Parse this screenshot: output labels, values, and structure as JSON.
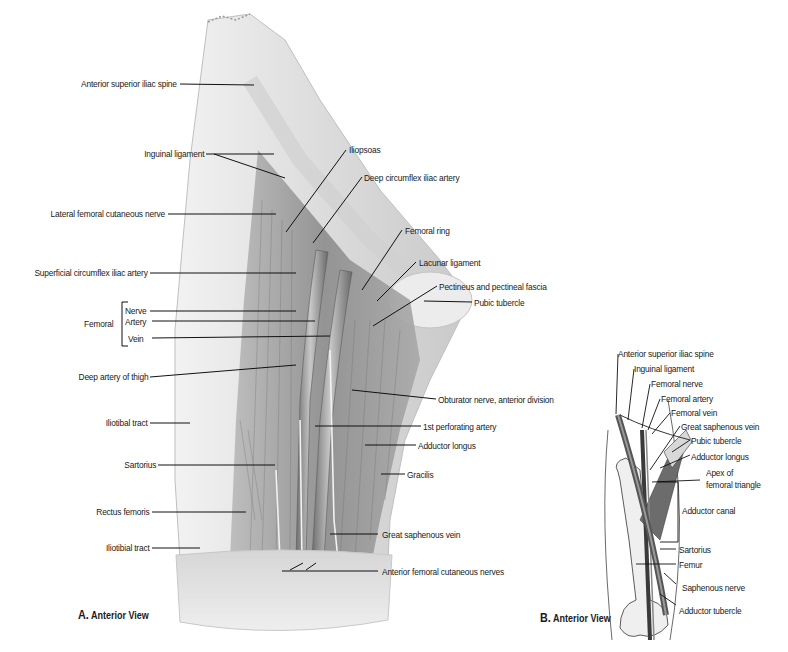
{
  "figure_a": {
    "caption_letter": "A.",
    "caption_text": "Anterior View",
    "labels_left": [
      {
        "id": "asis",
        "text": "Anterior superior iliac spine"
      },
      {
        "id": "inguinal",
        "text": "Inguinal ligament"
      },
      {
        "id": "lfcn",
        "text": "Lateral femoral cutaneous nerve"
      },
      {
        "id": "scia",
        "text": "Superficial circumflex iliac artery"
      },
      {
        "id": "deep_thigh",
        "text": "Deep artery of thigh"
      },
      {
        "id": "iliotibal",
        "text": "Iliotibal tract"
      },
      {
        "id": "sartorius",
        "text": "Sartorius"
      },
      {
        "id": "rectus",
        "text": "Rectus femoris"
      },
      {
        "id": "iliotibial",
        "text": "Iliotibial tract"
      }
    ],
    "femoral_group": {
      "title": "Femoral",
      "items": [
        "Nerve",
        "Artery",
        "Vein"
      ]
    },
    "labels_right": [
      {
        "id": "iliopsoas",
        "text": "Iliopsoas"
      },
      {
        "id": "dcia",
        "text": "Deep circumflex iliac artery"
      },
      {
        "id": "femoral_ring",
        "text": "Femoral ring"
      },
      {
        "id": "lacunar",
        "text": "Lacunar ligament"
      },
      {
        "id": "pectineus",
        "text": "Pectineus and pectineal fascia"
      },
      {
        "id": "pubic",
        "text": "Pubic tubercle"
      },
      {
        "id": "obturator",
        "text": "Obturator nerve, anterior division"
      },
      {
        "id": "perforating",
        "text": "1st perforating artery"
      },
      {
        "id": "add_longus",
        "text": "Adductor longus"
      },
      {
        "id": "gracilis",
        "text": "Gracilis"
      },
      {
        "id": "gsv",
        "text": "Great saphenous vein"
      },
      {
        "id": "afcn",
        "text": "Anterior femoral cutaneous nerves"
      }
    ]
  },
  "figure_b": {
    "caption_letter": "B.",
    "caption_text": "Anterior View",
    "labels": [
      {
        "id": "asis",
        "text": "Anterior superior iliac spine"
      },
      {
        "id": "inguinal",
        "text": "Inguinal ligament"
      },
      {
        "id": "fem_nerve",
        "text": "Femoral nerve"
      },
      {
        "id": "fem_artery",
        "text": "Femoral artery"
      },
      {
        "id": "fem_vein",
        "text": "Femoral vein"
      },
      {
        "id": "gsv",
        "text": "Great saphenous vein"
      },
      {
        "id": "pubic",
        "text": "Pubic tubercle"
      },
      {
        "id": "add_longus",
        "text": "Adductor longus"
      },
      {
        "id": "apex1",
        "text": "Apex of"
      },
      {
        "id": "apex2",
        "text": "femoral triangle"
      },
      {
        "id": "add_canal",
        "text": "Adductor canal"
      },
      {
        "id": "sartorius",
        "text": "Sartorius"
      },
      {
        "id": "femur",
        "text": "Femur"
      },
      {
        "id": "saph_nerve",
        "text": "Saphenous nerve"
      },
      {
        "id": "add_tubercle",
        "text": "Adductor tubercle"
      }
    ]
  },
  "colors": {
    "skin": "#e4e4e4",
    "muscle": "#9a9a9a",
    "vessel": "#7d7d7d",
    "leader": "#111111"
  }
}
